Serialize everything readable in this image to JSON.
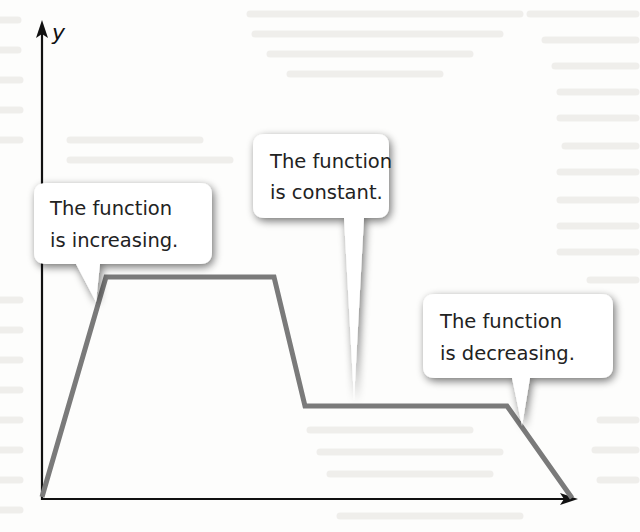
{
  "diagram": {
    "type": "piecewise-linear function graph with callouts",
    "axes": {
      "y_label": "y",
      "x_label": "",
      "origin_px": [
        42,
        498
      ],
      "y_axis_top_px": [
        42,
        22
      ],
      "x_axis_right_px": [
        576,
        499
      ]
    },
    "colors": {
      "axis": "#111111",
      "function_line": "#7a7a7a",
      "callout_fill": "#ffffff",
      "callout_shadow": "#9a9a9a",
      "text": "#222222",
      "background": "#fdfdfc"
    },
    "function_points_px": [
      [
        42,
        497
      ],
      [
        106,
        277
      ],
      [
        274,
        277
      ],
      [
        305,
        406
      ],
      [
        507,
        406
      ],
      [
        572,
        498
      ]
    ],
    "segments": [
      {
        "label": "increasing",
        "from": [
          42,
          497
        ],
        "to": [
          106,
          277
        ]
      },
      {
        "label": "constant-high",
        "from": [
          106,
          277
        ],
        "to": [
          274,
          277
        ]
      },
      {
        "label": "decreasing",
        "from": [
          274,
          277
        ],
        "to": [
          305,
          406
        ]
      },
      {
        "label": "constant",
        "from": [
          305,
          406
        ],
        "to": [
          507,
          406
        ]
      },
      {
        "label": "decreasing",
        "from": [
          507,
          406
        ],
        "to": [
          572,
          498
        ]
      }
    ],
    "callouts": [
      {
        "id": "increasing",
        "line1": "The function",
        "line2": "is increasing."
      },
      {
        "id": "constant",
        "line1": "The function",
        "line2": "is constant."
      },
      {
        "id": "decreasing",
        "line1": "The function",
        "line2": "is decreasing."
      }
    ]
  }
}
